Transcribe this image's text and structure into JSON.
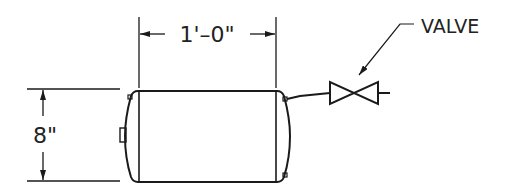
{
  "drawing": {
    "type": "tank elevation with valve",
    "dimensions": {
      "width_label": "1'–0\"",
      "height_label": "8\""
    },
    "callouts": {
      "valve_label": "VALVE"
    },
    "colors": {
      "line": "#1a1a1a",
      "background": "#ffffff"
    }
  }
}
